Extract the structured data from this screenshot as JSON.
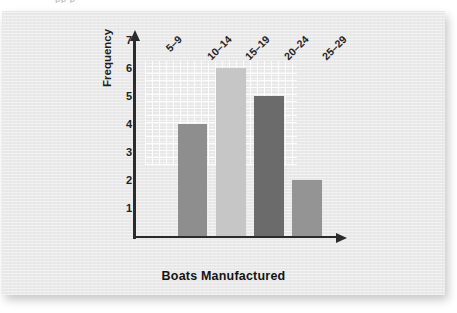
{
  "page": {
    "cropped_heading_fragment": "рр  р"
  },
  "chart_data": {
    "type": "bar",
    "title": "",
    "xlabel": "Boats Manufactured",
    "ylabel": "Frequency",
    "categories": [
      "5–9",
      "10–14",
      "15–19",
      "20–24",
      "25–29"
    ],
    "values": [
      0,
      4,
      6,
      5,
      2
    ],
    "bar_colors": [
      "#8e8e8e",
      "#8e8e8e",
      "#c6c6c6",
      "#6b6b6b",
      "#949494"
    ],
    "ylim": [
      0,
      7
    ],
    "y_ticks": [
      1,
      2,
      3,
      4,
      5,
      6,
      7
    ],
    "y_tick_labels": [
      "1",
      "2",
      "3",
      "4",
      "5",
      "6",
      "7"
    ],
    "grid": false,
    "legend": "none",
    "axis_color": "#2b2b2b",
    "background_color": "#e9e9e9"
  }
}
